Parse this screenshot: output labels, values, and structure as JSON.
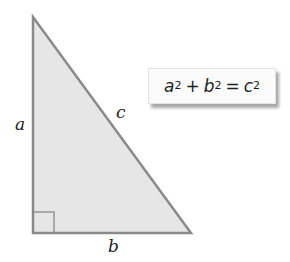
{
  "diagram": {
    "triangle": {
      "vertices": [
        [
          33,
          17
        ],
        [
          33,
          233
        ],
        [
          191,
          233
        ]
      ],
      "fill": "#e6e6e6",
      "stroke": "#8a8a8a",
      "right_angle_marker": {
        "x": 33,
        "y": 212,
        "size": 21
      }
    },
    "labels": {
      "a": "a",
      "b": "b",
      "c": "c"
    },
    "formula": {
      "term1_base": "a",
      "term1_exp": "2",
      "plus": "+",
      "term2_base": "b",
      "term2_exp": "2",
      "equals": "=",
      "term3_base": "c",
      "term3_exp": "2"
    }
  }
}
